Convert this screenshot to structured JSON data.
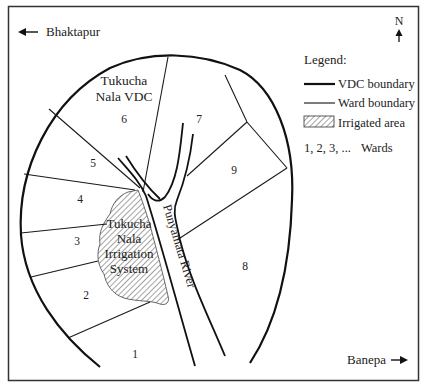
{
  "map": {
    "directions": {
      "west_label": "Bhaktapur",
      "east_label": "Banepa",
      "north_label": "N"
    },
    "region_label_line1": "Tukucha",
    "region_label_line2": "Nala VDC",
    "irrigation_label": [
      "Tukucha",
      "Nala",
      "Irrigation",
      "System"
    ],
    "river_label": "Punyamata River",
    "wards": [
      {
        "id": "1",
        "label": "1"
      },
      {
        "id": "2",
        "label": "2"
      },
      {
        "id": "3",
        "label": "3"
      },
      {
        "id": "4",
        "label": "4"
      },
      {
        "id": "5",
        "label": "5"
      },
      {
        "id": "6",
        "label": "6"
      },
      {
        "id": "7",
        "label": "7"
      },
      {
        "id": "8",
        "label": "8"
      },
      {
        "id": "9",
        "label": "9"
      }
    ],
    "legend": {
      "title": "Legend:",
      "items": [
        {
          "symbol": "thick-line",
          "label": "VDC boundary"
        },
        {
          "symbol": "thin-line",
          "label": "Ward boundary"
        },
        {
          "symbol": "hatched-box",
          "label": "Irrigated area"
        },
        {
          "symbol": "text",
          "symbol_text": "1, 2, 3, ...",
          "label": "Wards"
        }
      ]
    },
    "colors": {
      "line": "#1a1a1a",
      "background": "#ffffff",
      "hatch": "#555555"
    }
  }
}
